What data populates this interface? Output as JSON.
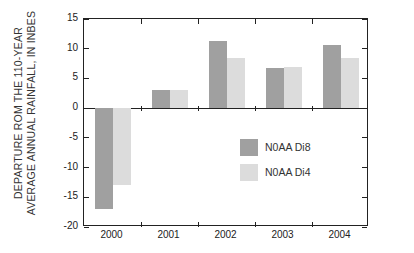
{
  "chart_data": {
    "type": "bar",
    "title": "",
    "xlabel": "",
    "ylabel": "DEPARTURE ROM THE 110-YEAR AVERAGE ANNUAL RAINFALL, IN INBES",
    "ylabel_lines": [
      "DEPARTURE ROM THE 110-YEAR",
      "AVERAGE ANNUAL RAINFALL, IN INBES"
    ],
    "categories": [
      "2000",
      "2001",
      "2002",
      "2003",
      "2004"
    ],
    "series": [
      {
        "name": "N0AA Di8",
        "color": "#a0a0a0",
        "values": [
          -17,
          3,
          11.3,
          6.7,
          10.6
        ]
      },
      {
        "name": "N0AA Di4",
        "color": "#dcdcdc",
        "values": [
          -13,
          3,
          8.4,
          7,
          8.5
        ]
      }
    ],
    "ylim": [
      -20,
      15
    ],
    "yticks": [
      15,
      10,
      5,
      0,
      -5,
      -10,
      -15,
      -20
    ],
    "ytick_labels": [
      "15",
      "10",
      "5",
      "0",
      "-5",
      "-10",
      "-15",
      "-20"
    ],
    "grid": false,
    "legend_position": "inside-right-middle"
  },
  "legend": {
    "items": [
      {
        "label": "N0AA Di8",
        "color": "#a0a0a0"
      },
      {
        "label": "N0AA Di4",
        "color": "#dcdcdc"
      }
    ]
  }
}
